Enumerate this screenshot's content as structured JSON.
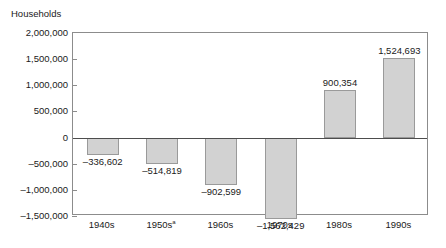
{
  "chart_data": {
    "type": "bar",
    "title": "",
    "ylabel": "Households",
    "xlabel": "",
    "categories": [
      "1940s",
      "1950s",
      "1960s",
      "1970s",
      "1980s",
      "1990s"
    ],
    "category_footnotes": [
      "",
      "a",
      "",
      "",
      "",
      ""
    ],
    "values": [
      -336602,
      -514819,
      -902599,
      -1562429,
      900354,
      1524693
    ],
    "value_labels": [
      "–336,602",
      "–514,819",
      "–902,599",
      "–1,562,429",
      "900,354",
      "1,524,693"
    ],
    "ylim": [
      -1500000,
      2000000
    ],
    "ytick_values": [
      2000000,
      1500000,
      1000000,
      500000,
      0,
      -500000,
      -1000000,
      -1500000
    ],
    "ytick_labels": [
      "2,000,000",
      "1,500,000",
      "1,000,000",
      "500,000",
      "0",
      "–500,000",
      "–1,000,000",
      "–1,500,000"
    ],
    "grid": false,
    "legend": "none",
    "bar_fill_color": "#d2d2d2",
    "bar_border_color": "#9a9a9a",
    "axis_color": "#8c8c8c",
    "zero_line_color": "#4d4d4d"
  }
}
